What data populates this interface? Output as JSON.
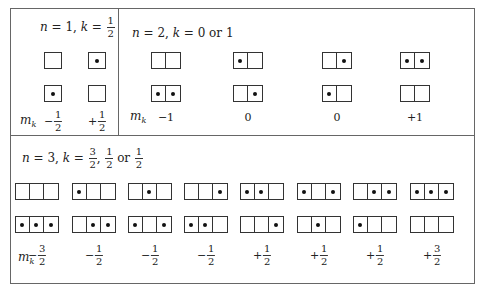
{
  "figure": {
    "panels": [
      {
        "id": "n1",
        "title": "n = 1, k = 1/2",
        "title_parts": {
          "n": "1",
          "k": "1/2"
        },
        "cells_per_row": 1,
        "columns": [
          {
            "x": 53,
            "top": [
              0
            ],
            "bottom": [
              1
            ],
            "mk": "-1/2",
            "mk_sign": "−",
            "mk_num": "1",
            "mk_den": "2"
          },
          {
            "x": 97,
            "top": [
              1
            ],
            "bottom": [
              0
            ],
            "mk": "+1/2",
            "mk_sign": "+",
            "mk_num": "1",
            "mk_den": "2"
          }
        ]
      },
      {
        "id": "n2",
        "title": "n = 2, k = 0 or 1",
        "title_parts": {
          "n": "2",
          "k": "0 or 1"
        },
        "cells_per_row": 2,
        "columns": [
          {
            "x": 166,
            "top": [
              0,
              0
            ],
            "bottom": [
              1,
              1
            ],
            "mk": "−1"
          },
          {
            "x": 248,
            "top": [
              1,
              0
            ],
            "bottom": [
              0,
              1
            ],
            "mk": "0"
          },
          {
            "x": 337,
            "top": [
              0,
              1
            ],
            "bottom": [
              1,
              0
            ],
            "mk": "0"
          },
          {
            "x": 415,
            "top": [
              1,
              1
            ],
            "bottom": [
              0,
              0
            ],
            "mk": "+1"
          }
        ]
      },
      {
        "id": "n3",
        "title": "n = 3, k = 3/2, 1/2 or 1/2",
        "title_parts": {
          "n": "3",
          "k": "3/2, 1/2 or 1/2"
        },
        "cells_per_row": 3,
        "columns": [
          {
            "x": 37,
            "top": [
              0,
              0,
              0
            ],
            "bottom": [
              1,
              1,
              1
            ],
            "mk": "-3/2",
            "mk_sign": "−",
            "mk_num": "3",
            "mk_den": "2"
          },
          {
            "x": 94,
            "top": [
              1,
              0,
              0
            ],
            "bottom": [
              0,
              1,
              1
            ],
            "mk": "-1/2",
            "mk_sign": "−",
            "mk_num": "1",
            "mk_den": "2"
          },
          {
            "x": 150,
            "top": [
              0,
              1,
              0
            ],
            "bottom": [
              1,
              0,
              1
            ],
            "mk": "-1/2",
            "mk_sign": "−",
            "mk_num": "1",
            "mk_den": "2"
          },
          {
            "x": 206,
            "top": [
              0,
              0,
              1
            ],
            "bottom": [
              1,
              1,
              0
            ],
            "mk": "-1/2",
            "mk_sign": "−",
            "mk_num": "1",
            "mk_den": "2"
          },
          {
            "x": 262,
            "top": [
              1,
              1,
              0
            ],
            "bottom": [
              0,
              0,
              1
            ],
            "mk": "+1/2",
            "mk_sign": "+",
            "mk_num": "1",
            "mk_den": "2"
          },
          {
            "x": 319,
            "top": [
              1,
              0,
              1
            ],
            "bottom": [
              0,
              1,
              0
            ],
            "mk": "+1/2",
            "mk_sign": "+",
            "mk_num": "1",
            "mk_den": "2"
          },
          {
            "x": 375,
            "top": [
              0,
              1,
              1
            ],
            "bottom": [
              1,
              0,
              0
            ],
            "mk": "+1/2",
            "mk_sign": "+",
            "mk_num": "1",
            "mk_den": "2"
          },
          {
            "x": 432,
            "top": [
              1,
              1,
              1
            ],
            "bottom": [
              0,
              0,
              0
            ],
            "mk": "+3/2",
            "mk_sign": "+",
            "mk_num": "3",
            "mk_den": "2"
          }
        ]
      }
    ],
    "mk_label": "m",
    "mk_sub": "k"
  }
}
